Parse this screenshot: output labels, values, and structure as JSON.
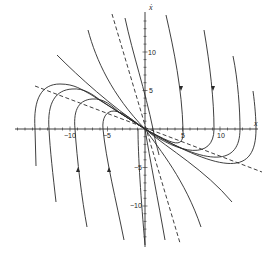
{
  "diagram": {
    "type": "phase-portrait",
    "axes": {
      "x_label": "x",
      "y_label": "ẋ",
      "x_ticks": [
        {
          "value": -10,
          "label": "−10"
        },
        {
          "value": -5,
          "label": "−5"
        },
        {
          "value": 5,
          "label": "5"
        },
        {
          "value": 10,
          "label": "10"
        }
      ],
      "y_ticks": [
        {
          "value": 10,
          "label": "10"
        },
        {
          "value": 5,
          "label": "5"
        },
        {
          "value": -5,
          "label": "−5"
        },
        {
          "value": -10,
          "label": "−10"
        }
      ]
    },
    "elements": {
      "trajectories": "solid curves (phase paths) with direction arrows",
      "asymptotes": "two dashed straight lines through origin (eigen-directions)",
      "equilibrium": "origin (0,0) — stable node"
    },
    "colors": {
      "stroke": "#2a2a2a",
      "background": "#ffffff"
    }
  }
}
